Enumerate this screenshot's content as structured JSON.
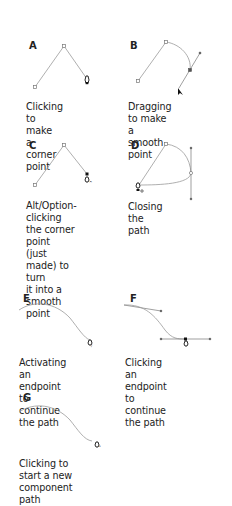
{
  "figure": {
    "panels": [
      {
        "id": "A",
        "letter": "A",
        "caption_lines": [
          "Clicking to make",
          "a corner point"
        ]
      },
      {
        "id": "B",
        "letter": "B",
        "caption_lines": [
          "Dragging to make",
          "a smooth point"
        ]
      },
      {
        "id": "C",
        "letter": "C",
        "caption_lines": [
          "Alt/Option-clicking",
          "the corner point",
          "(just made) to turn",
          "it into a smooth",
          "point"
        ]
      },
      {
        "id": "D",
        "letter": "D",
        "caption_lines": [
          "Closing the path"
        ]
      },
      {
        "id": "E",
        "letter": "E",
        "caption_lines": [
          "Activating an endpoint",
          "to continue the path"
        ]
      },
      {
        "id": "F",
        "letter": "F",
        "caption_lines": [
          "Clicking an endpoint",
          "to continue the path"
        ]
      },
      {
        "id": "G",
        "letter": "G",
        "caption_lines": [
          "Clicking to start a new",
          "component path"
        ]
      }
    ],
    "colors": {
      "path": "#9a9a9a",
      "anchor": "#777777",
      "pen": "#111111"
    }
  }
}
